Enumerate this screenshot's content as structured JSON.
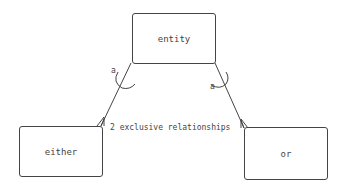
{
  "diagram": {
    "type": "entity-relationship",
    "entities": [
      {
        "id": "entity",
        "label": "entity"
      },
      {
        "id": "either",
        "label": "either"
      },
      {
        "id": "or",
        "label": "or"
      }
    ],
    "relationships": [
      {
        "from": "entity",
        "to": "either",
        "label": "a"
      },
      {
        "from": "entity",
        "to": "or",
        "label": "a"
      }
    ],
    "annotation": "2 exclusive relationships",
    "colors": {
      "stroke": "#444444",
      "background": "#ffffff"
    }
  }
}
